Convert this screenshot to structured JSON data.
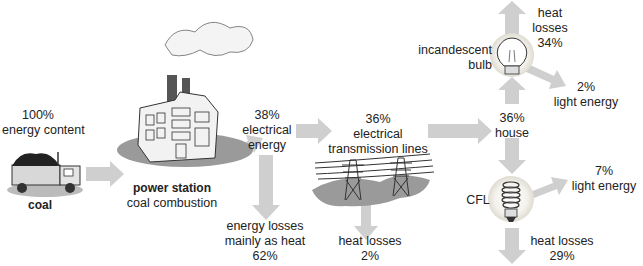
{
  "diagram": {
    "type": "energy-flow",
    "colors": {
      "arrow": "#cfcfcf",
      "ground": "#9a9a9a",
      "text": "#222222",
      "glow": "#f2efe6"
    },
    "nodes": {
      "coal": {
        "percent": "100%",
        "caption": "energy content",
        "label": "coal"
      },
      "power_station": {
        "title": "power station",
        "subtitle": "coal combustion"
      },
      "electrical_energy": {
        "percent": "38%",
        "line1": "electrical",
        "line2": "energy"
      },
      "power_station_loss": {
        "line1": "energy losses",
        "line2": "mainly as heat",
        "percent": "62%"
      },
      "transmission": {
        "percent": "36%",
        "line1": "electrical",
        "line2": "transmission lines"
      },
      "transmission_loss": {
        "line1": "heat losses",
        "percent": "2%"
      },
      "house": {
        "percent": "36%",
        "label": "house"
      },
      "incandescent": {
        "line1": "incandescent",
        "line2": "bulb"
      },
      "incandescent_heat": {
        "line1": "heat",
        "line2": "losses",
        "percent": "34%"
      },
      "incandescent_light": {
        "percent": "2%",
        "label": "light energy"
      },
      "cfl": {
        "label": "CFL"
      },
      "cfl_light": {
        "percent": "7%",
        "label": "light energy"
      },
      "cfl_heat": {
        "label": "heat losses",
        "percent": "29%"
      }
    }
  }
}
